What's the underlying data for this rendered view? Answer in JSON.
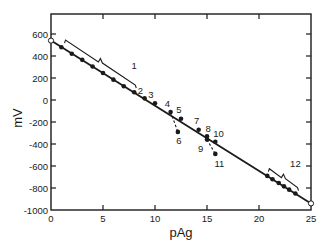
{
  "chart_data": {
    "type": "scatter",
    "title": "",
    "xlabel": "pAg",
    "ylabel": "mV",
    "xlim": [
      0,
      25
    ],
    "ylim": [
      -1000,
      700
    ],
    "xticks": [
      0,
      5,
      10,
      15,
      20,
      25
    ],
    "xtick_labels": [
      "0",
      "5",
      "10",
      "15",
      "20",
      "25"
    ],
    "yticks": [
      600,
      400,
      200,
      0,
      -200,
      -400,
      -600,
      -800,
      -1000
    ],
    "ytick_labels": [
      "600",
      "400",
      "200",
      "0",
      "-200",
      "-400",
      "-600",
      "-800",
      "-1000"
    ],
    "grid": false,
    "legend": null,
    "fit_line": {
      "x": [
        0,
        25
      ],
      "y": [
        540,
        -940
      ],
      "endpoints_marker": "open-circle",
      "slope_mV_per_pAg": -59.2
    },
    "series": [
      {
        "name": "1",
        "marker": "filled-circle",
        "x": [
          1,
          2,
          3,
          4,
          5,
          6,
          7,
          8
        ],
        "y": [
          480,
          420,
          365,
          305,
          245,
          185,
          125,
          70
        ]
      },
      {
        "name": "2",
        "marker": "filled-circle",
        "x": [
          9
        ],
        "y": [
          15
        ]
      },
      {
        "name": "3",
        "marker": "filled-circle",
        "x": [
          10
        ],
        "y": [
          -30
        ]
      },
      {
        "name": "4",
        "marker": "filled-circle",
        "x": [
          11.5
        ],
        "y": [
          -110
        ]
      },
      {
        "name": "5",
        "marker": "filled-circle",
        "x": [
          12.5
        ],
        "y": [
          -170
        ]
      },
      {
        "name": "6",
        "marker": "filled-circle",
        "x": [
          12.2
        ],
        "y": [
          -290
        ],
        "branch_from": "4",
        "branch_style": "dashed"
      },
      {
        "name": "7",
        "marker": "filled-circle",
        "x": [
          14.2
        ],
        "y": [
          -270
        ]
      },
      {
        "name": "8",
        "marker": "filled-circle",
        "x": [
          15
        ],
        "y": [
          -330
        ]
      },
      {
        "name": "9",
        "marker": "filled-circle",
        "x": [
          15
        ],
        "y": [
          -360
        ]
      },
      {
        "name": "10",
        "marker": "filled-circle",
        "x": [
          15.8
        ],
        "y": [
          -380
        ]
      },
      {
        "name": "11",
        "marker": "filled-circle",
        "x": [
          15.8
        ],
        "y": [
          -490
        ],
        "branch_from": "9",
        "branch_style": "dashed"
      },
      {
        "name": "12",
        "marker": "filled-circle",
        "x": [
          20.8,
          21.3,
          21.9,
          22.4,
          22.9,
          23.5
        ],
        "y": [
          -690,
          -720,
          -755,
          -785,
          -815,
          -850
        ]
      }
    ],
    "annotations": [
      {
        "text": "1",
        "type": "bracket-label",
        "x": 8,
        "y": 310
      },
      {
        "text": "2",
        "x": 8.6,
        "y": 90
      },
      {
        "text": "3",
        "x": 9.6,
        "y": 50
      },
      {
        "text": "4",
        "x": 11.2,
        "y": -30
      },
      {
        "text": "5",
        "x": 12.3,
        "y": -90
      },
      {
        "text": "6",
        "x": 12.3,
        "y": -370
      },
      {
        "text": "7",
        "x": 14,
        "y": -190
      },
      {
        "text": "8",
        "x": 15.1,
        "y": -255
      },
      {
        "text": "9",
        "x": 14.4,
        "y": -440
      },
      {
        "text": "10",
        "x": 16.1,
        "y": -300
      },
      {
        "text": "11",
        "x": 16.2,
        "y": -575
      },
      {
        "text": "12",
        "type": "bracket-label",
        "x": 23.5,
        "y": -580
      }
    ]
  },
  "axes": {
    "xlabel": "pAg",
    "ylabel": "mV"
  }
}
